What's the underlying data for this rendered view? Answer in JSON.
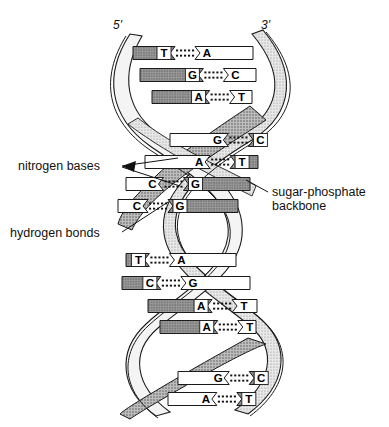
{
  "diagram": {
    "end_labels": {
      "left": "5'",
      "right": "3'"
    },
    "annotations": {
      "nitrogen_bases": "nitrogen bases",
      "hydrogen_bonds": "hydrogen bonds",
      "sugar_phosphate_backbone_line1": "sugar-phosphate",
      "sugar_phosphate_backbone_line2": "backbone"
    },
    "colors": {
      "ink": "#111111",
      "dark_base": "#6e6e6e",
      "light_base": "#ffffff",
      "ribbon_stipple": "#c9c9c9",
      "ribbon_light": "#f2f2f2",
      "outline": "#1a1a1a"
    },
    "base_pairs": [
      {
        "left": "T",
        "right": "A",
        "left_fill": "dark",
        "right_fill": "light",
        "y": 53,
        "x1": 133,
        "x2": 253,
        "split": 0.42
      },
      {
        "left": "G",
        "right": "C",
        "left_fill": "dark",
        "right_fill": "light",
        "y": 75,
        "x1": 140,
        "x2": 256,
        "split": 0.66
      },
      {
        "left": "A",
        "right": "T",
        "left_fill": "dark",
        "right_fill": "light",
        "y": 97,
        "x1": 152,
        "x2": 252,
        "split": 0.72
      },
      {
        "left": "G",
        "right": "C",
        "left_fill": "light",
        "right_fill": "dark",
        "y": 140,
        "x1": 170,
        "x2": 263,
        "split": 0.8
      },
      {
        "left": "A",
        "right": "T",
        "left_fill": "light",
        "right_fill": "dark",
        "y": 162,
        "x1": 145,
        "x2": 258,
        "split": 0.7
      },
      {
        "left": "C",
        "right": "G",
        "left_fill": "light",
        "right_fill": "dark",
        "y": 184,
        "x1": 126,
        "x2": 250,
        "split": 0.36
      },
      {
        "left": "C",
        "right": "G",
        "left_fill": "light",
        "right_fill": "dark",
        "y": 206,
        "x1": 118,
        "x2": 238,
        "split": 0.3
      },
      {
        "left": "T",
        "right": "A",
        "left_fill": "dark",
        "right_fill": "light",
        "y": 260,
        "x1": 126,
        "x2": 236,
        "split": 0.26
      },
      {
        "left": "C",
        "right": "G",
        "left_fill": "dark",
        "right_fill": "light",
        "y": 283,
        "x1": 122,
        "x2": 250,
        "split": 0.36
      },
      {
        "left": "A",
        "right": "T",
        "left_fill": "dark",
        "right_fill": "light",
        "y": 306,
        "x1": 148,
        "x2": 257,
        "split": 0.72
      },
      {
        "left": "A",
        "right": "T",
        "left_fill": "dark",
        "right_fill": "light",
        "y": 327,
        "x1": 160,
        "x2": 256,
        "split": 0.76
      },
      {
        "left": "G",
        "right": "C",
        "left_fill": "light",
        "right_fill": "dark",
        "y": 378,
        "x1": 178,
        "x2": 262,
        "split": 0.8
      },
      {
        "left": "A",
        "right": "T",
        "left_fill": "light",
        "right_fill": "dark",
        "y": 399,
        "x1": 168,
        "x2": 254,
        "split": 0.74
      }
    ]
  }
}
